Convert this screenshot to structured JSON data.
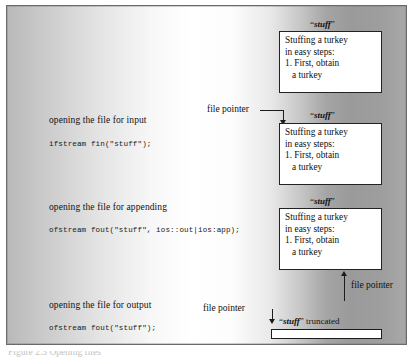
{
  "figure": {
    "caption_partial": "Figure 2.3 Opening files",
    "background_note": "grayscale gradient panel"
  },
  "left_column": {
    "sections": [
      {
        "label": "opening the file for input",
        "code": "ifstream fin(\"stuff\");"
      },
      {
        "label": "opening the file for appending",
        "code": "ofstream fout(\"stuff\", ios::out|ios:app);"
      },
      {
        "label": "opening the file for output",
        "code": "ofstream fout(\"stuff\");"
      }
    ]
  },
  "files": [
    {
      "title_quote_open": "“",
      "title_name": "stuff",
      "title_quote_close": "”",
      "lines": [
        "Stuffing a turkey",
        "in easy steps:",
        "1. First, obtain",
        "a turkey"
      ]
    },
    {
      "title_quote_open": "“",
      "title_name": "stuff",
      "title_quote_close": "”",
      "lines": [
        "Stuffing a turkey",
        "in easy steps:",
        "1. First, obtain",
        "a turkey"
      ]
    },
    {
      "title_quote_open": "“",
      "title_name": "stuff",
      "title_quote_close": "”",
      "lines": [
        "Stuffing a turkey",
        "in easy steps:",
        "1. First, obtain",
        "a turkey"
      ]
    }
  ],
  "pointers": {
    "input_pointer_label": "file pointer",
    "append_pointer_label": "file pointer",
    "output_pointer_label": "file pointer"
  },
  "truncated": {
    "quote_open": "“",
    "name": "stuff",
    "quote_close": "”",
    "suffix": " truncated"
  },
  "colors": {
    "box_border": "#222222",
    "box_fill": "#ffffff",
    "text": "#111111",
    "arrow": "#1c1c1c",
    "panel_border": "#6a6a6a"
  }
}
